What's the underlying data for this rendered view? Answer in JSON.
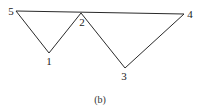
{
  "figure": {
    "caption": "(b)",
    "vertices": [
      {
        "id": "1",
        "label": "1",
        "x": 49,
        "y": 53,
        "label_x": 49,
        "label_y": 65
      },
      {
        "id": "2",
        "label": "2",
        "x": 81,
        "y": 13,
        "label_x": 82,
        "label_y": 26
      },
      {
        "id": "3",
        "label": "3",
        "x": 125,
        "y": 68,
        "label_x": 124,
        "label_y": 80
      },
      {
        "id": "4",
        "label": "4",
        "x": 184,
        "y": 14,
        "label_x": 190,
        "label_y": 18
      },
      {
        "id": "5",
        "label": "5",
        "x": 16,
        "y": 11,
        "label_x": 11,
        "label_y": 15
      }
    ],
    "edges": [
      {
        "from": "5",
        "to": "4"
      },
      {
        "from": "5",
        "to": "1"
      },
      {
        "from": "1",
        "to": "2"
      },
      {
        "from": "2",
        "to": "3"
      },
      {
        "from": "3",
        "to": "4"
      }
    ]
  }
}
